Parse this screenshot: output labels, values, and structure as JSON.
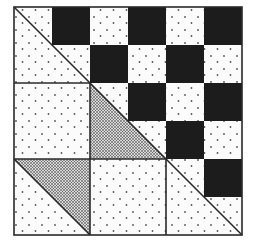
{
  "figure": {
    "title": "",
    "colors": {
      "background": "#ffffff",
      "dark": "#1c1c1c",
      "light": "#fbfbfb",
      "line": "#2a2a2a",
      "dot": "#555555"
    },
    "block": {
      "left": 14,
      "top": 7,
      "cell": 38,
      "cells": 6
    },
    "dark_cells": [
      [
        1,
        0
      ],
      [
        3,
        0
      ],
      [
        5,
        0
      ],
      [
        2,
        1
      ],
      [
        4,
        1
      ],
      [
        3,
        2
      ],
      [
        5,
        2
      ],
      [
        4,
        3
      ],
      [
        5,
        4
      ]
    ],
    "light_cells": [
      [
        2,
        0
      ],
      [
        4,
        0
      ],
      [
        3,
        1
      ],
      [
        5,
        1
      ],
      [
        4,
        2
      ],
      [
        3,
        3
      ],
      [
        5,
        3
      ],
      [
        5,
        5
      ]
    ]
  }
}
